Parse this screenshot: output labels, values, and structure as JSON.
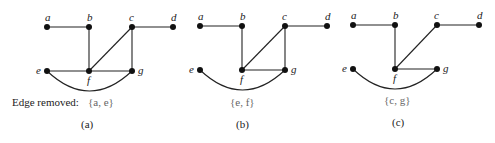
{
  "figure": {
    "caption_prefix": "Edge removed:",
    "panels": [
      {
        "id": "a",
        "label": "(a)",
        "removed_edge": "{a, e}",
        "nodes": {
          "a": [
            47,
            27
          ],
          "b": [
            89,
            27
          ],
          "c": [
            132,
            27
          ],
          "d": [
            173,
            27
          ],
          "e": [
            47,
            71
          ],
          "f": [
            89,
            71
          ],
          "g": [
            132,
            71
          ]
        },
        "edges": [
          [
            "a",
            "b"
          ],
          [
            "b",
            "f"
          ],
          [
            "c",
            "d"
          ],
          [
            "c",
            "f"
          ],
          [
            "c",
            "g"
          ],
          [
            "e",
            "f"
          ],
          [
            "f",
            "g"
          ]
        ],
        "arc": [
          "e",
          "g"
        ]
      },
      {
        "id": "b",
        "label": "(b)",
        "removed_edge": "{e, f}",
        "nodes": {
          "a": [
            200,
            26
          ],
          "b": [
            242,
            26
          ],
          "c": [
            285,
            26
          ],
          "d": [
            327,
            26
          ],
          "e": [
            200,
            70
          ],
          "f": [
            242,
            70
          ],
          "g": [
            285,
            70
          ]
        },
        "edges": [
          [
            "a",
            "b"
          ],
          [
            "b",
            "f"
          ],
          [
            "c",
            "d"
          ],
          [
            "c",
            "f"
          ],
          [
            "c",
            "g"
          ],
          [
            "f",
            "g"
          ]
        ],
        "arc": [
          "e",
          "g"
        ]
      },
      {
        "id": "c",
        "label": "(c)",
        "removed_edge": "{c, g}",
        "nodes": {
          "a": [
            353,
            25
          ],
          "b": [
            395,
            25
          ],
          "c": [
            437,
            25
          ],
          "d": [
            479,
            25
          ],
          "e": [
            353,
            69
          ],
          "f": [
            395,
            69
          ],
          "g": [
            437,
            69
          ]
        },
        "edges": [
          [
            "a",
            "b"
          ],
          [
            "b",
            "f"
          ],
          [
            "c",
            "d"
          ],
          [
            "c",
            "f"
          ],
          [
            "f",
            "g"
          ]
        ],
        "arc": [
          "e",
          "g"
        ]
      }
    ],
    "node_labels": {
      "a": "a",
      "b": "b",
      "c": "c",
      "d": "d",
      "e": "e",
      "f": "f",
      "g": "g"
    }
  }
}
